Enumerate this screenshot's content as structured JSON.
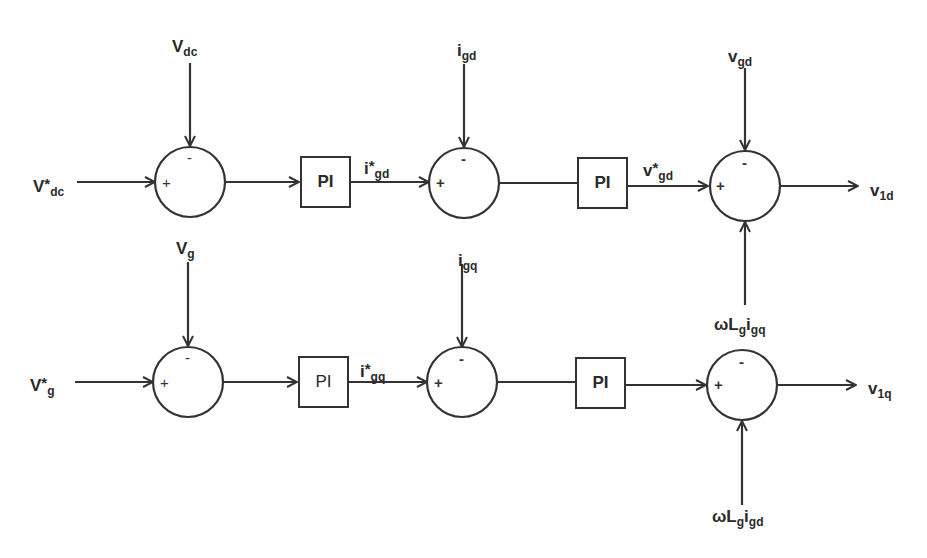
{
  "diagram": {
    "type": "control-block-diagram",
    "rows": [
      {
        "id": "d-axis",
        "reference_input": {
          "main": "V",
          "sup": "*",
          "sub": "dc"
        },
        "feedback_input": {
          "main": "V",
          "sub": "dc"
        },
        "sum1_signs": {
          "left": "+",
          "top": "-"
        },
        "pi1_label": "PI",
        "pi1_output": {
          "main": "i",
          "sup": "*",
          "sub": "gd"
        },
        "current_feedback": {
          "main": "i",
          "sub": "gd"
        },
        "sum2_signs": {
          "left": "+",
          "top": "-"
        },
        "pi2_label": "PI",
        "pi2_output": {
          "main": "v",
          "sup": "*",
          "sub": "gd"
        },
        "voltage_feedforward": {
          "main": "v",
          "sub": "gd"
        },
        "sum3_signs": {
          "left": "+",
          "top": "-"
        },
        "coupling_term": {
          "pre": "ωL",
          "sub1": "g",
          "mid": "i",
          "sub2": "gq"
        },
        "output": {
          "main": "v",
          "sub": "1d"
        }
      },
      {
        "id": "q-axis",
        "reference_input": {
          "main": "V",
          "sup": "*",
          "sub": "g"
        },
        "feedback_input": {
          "main": "V",
          "sub": "g"
        },
        "sum1_signs": {
          "left": "+",
          "top": "-"
        },
        "pi1_label": "PI",
        "pi1_output": {
          "main": "i",
          "sup": "*",
          "sub": "gq"
        },
        "current_feedback": {
          "main": "i",
          "sub": "gq"
        },
        "sum2_signs": {
          "left": "+",
          "top": "-"
        },
        "pi2_label": "PI",
        "sum3_signs": {
          "left": "+",
          "top": "-"
        },
        "coupling_term": {
          "pre": "ωL",
          "sub1": "g",
          "mid": "i",
          "sub2": "gd"
        },
        "output": {
          "main": "v",
          "sub": "1q"
        }
      }
    ],
    "colors": {
      "stroke": "#333333",
      "text": "#2a2a2a",
      "background": "#ffffff"
    }
  }
}
